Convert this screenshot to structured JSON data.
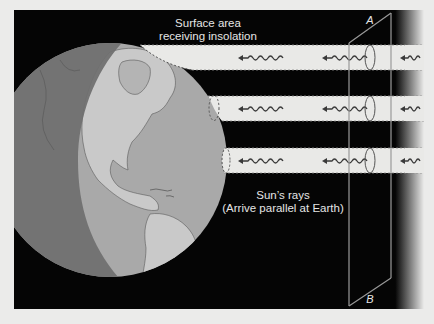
{
  "diagram": {
    "title_label": {
      "line1": "Surface area",
      "line2": "receiving insolation"
    },
    "rays_label": {
      "line1": "Sun’s rays",
      "line2": "(Arrive parallel at Earth)"
    },
    "plane": {
      "top_label": "A",
      "bottom_label": "B"
    },
    "ray_bands": [
      {
        "id": "high-latitude",
        "y_top": 45,
        "y_bottom": 70
      },
      {
        "id": "mid-latitude",
        "y_top": 96,
        "y_bottom": 121
      },
      {
        "id": "low-latitude",
        "y_top": 148,
        "y_bottom": 173
      }
    ],
    "colors": {
      "page_background": "#ebebea",
      "space": "#050505",
      "globe_dark_side": "#6f6f6f",
      "globe_lit_ocean": "#a9a9a9",
      "globe_lit_land": "#c9c9c9",
      "ray_band": "#e9e9e7",
      "plane_line": "#9a9a9a"
    }
  }
}
